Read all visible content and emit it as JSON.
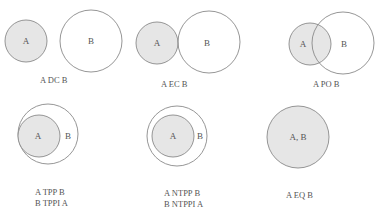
{
  "colors": {
    "fill_a": "#e6e6e6",
    "stroke": "#8a8a8a",
    "text": "#555555",
    "background": "#ffffff"
  },
  "panels": [
    {
      "id": "dc",
      "relation": "DC",
      "circles": [
        {
          "label": "A",
          "cx": 26,
          "cy": 41,
          "r": 21,
          "filled": true
        },
        {
          "label": "B",
          "cx": 91,
          "cy": 41,
          "r": 31,
          "filled": false
        }
      ],
      "captions": [
        "A DC B"
      ]
    },
    {
      "id": "ec",
      "relation": "EC",
      "circles": [
        {
          "label": "A",
          "cx": 157,
          "cy": 43,
          "r": 21,
          "filled": true
        },
        {
          "label": "B",
          "cx": 208,
          "cy": 42,
          "r": 31,
          "filled": false
        }
      ],
      "captions": [
        "A EC B"
      ]
    },
    {
      "id": "po",
      "relation": "PO",
      "circles": [
        {
          "label": "A",
          "cx": 317,
          "cy": 44,
          "r": 21,
          "filled": true
        },
        {
          "label": "B",
          "cx": 343,
          "cy": 43,
          "r": 31,
          "filled": false
        }
      ],
      "captions": [
        "A PO B"
      ]
    },
    {
      "id": "tpp",
      "relation": "TPP",
      "circles": [
        {
          "label": "B",
          "cx": 34,
          "cy": 135,
          "r": 31,
          "filled": false
        },
        {
          "label": "A",
          "cx": 39,
          "cy": 136,
          "r": 22,
          "filled": true
        }
      ],
      "captions": [
        "A TPP B",
        "B TPPI  A"
      ]
    },
    {
      "id": "ntpp",
      "relation": "NTPP",
      "circles": [
        {
          "label": "B",
          "cx": 177,
          "cy": 136,
          "r": 30,
          "filled": false
        },
        {
          "label": "A",
          "cx": 173,
          "cy": 136,
          "r": 21,
          "filled": true
        }
      ],
      "captions": [
        "A NTPP  B",
        "B NTPPI   A"
      ]
    },
    {
      "id": "eq",
      "relation": "EQ",
      "circles": [
        {
          "label": "A, B",
          "cx": 298,
          "cy": 137,
          "r": 31,
          "filled": true
        }
      ],
      "captions": [
        "A EQ B"
      ]
    }
  ],
  "circle_labels": {
    "dc_a": {
      "text": "A",
      "x": 26,
      "y": 44
    },
    "dc_b": {
      "text": "B",
      "x": 91,
      "y": 44
    },
    "ec_a": {
      "text": "A",
      "x": 157,
      "y": 46
    },
    "ec_b": {
      "text": "B",
      "x": 207,
      "y": 46
    },
    "po_a": {
      "text": "A",
      "x": 303,
      "y": 47
    },
    "po_b": {
      "text": "B",
      "x": 344,
      "y": 47
    },
    "tpp_a": {
      "text": "A",
      "x": 38,
      "y": 139
    },
    "tpp_b": {
      "text": "B",
      "x": 68,
      "y": 139
    },
    "ntpp_a": {
      "text": "A",
      "x": 173,
      "y": 139
    },
    "ntpp_b": {
      "text": "B",
      "x": 200,
      "y": 139
    },
    "eq_ab": {
      "text": "A, B",
      "x": 298,
      "y": 140
    }
  },
  "captions": {
    "dc": "A DC B",
    "ec": "A EC B",
    "po": "A PO B",
    "tpp_1": "A TPP B",
    "tpp_2": "B TPPI  A",
    "ntpp_1": "A NTPP  B",
    "ntpp_2": "B NTPPI   A",
    "eq": "A EQ B"
  }
}
